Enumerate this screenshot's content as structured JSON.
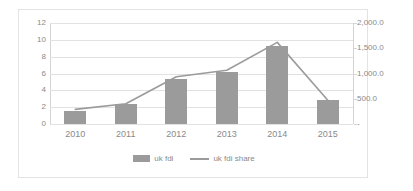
{
  "chart_data": {
    "type": "bar",
    "title": "",
    "xlabel": "",
    "ylabel": "",
    "grid": true,
    "legend_position": "bottom",
    "categories": [
      "2010",
      "2011",
      "2012",
      "2013",
      "2014",
      "2015"
    ],
    "axes": {
      "left": {
        "ylim": [
          0,
          12
        ],
        "ticks": [
          "0",
          "2",
          "4",
          "6",
          "8",
          "10",
          "12"
        ],
        "tick_values": [
          0,
          2,
          4,
          6,
          8,
          10,
          12
        ]
      },
      "right": {
        "ylim": [
          0,
          2000
        ],
        "ticks": [
          "-",
          "500.0",
          "1,000.0",
          "1,500.0",
          "2,000.0"
        ],
        "tick_values": [
          0,
          500,
          1000,
          1500,
          2000
        ]
      }
    },
    "series": [
      {
        "name": "uk fdi",
        "type": "bar",
        "axis": "left",
        "color": "#9b9b9b",
        "values": [
          1.6,
          2.4,
          5.4,
          6.2,
          9.3,
          2.8
        ]
      },
      {
        "name": "uk fdi share",
        "type": "line",
        "axis": "right",
        "color": "#9b9b9b",
        "values": [
          290,
          400,
          935,
          1065,
          1615,
          470
        ]
      }
    ]
  },
  "legend": {
    "items": [
      {
        "label": "uk fdi",
        "marker": "bar-swatch"
      },
      {
        "label": "uk fdi share",
        "marker": "line-swatch"
      }
    ]
  }
}
